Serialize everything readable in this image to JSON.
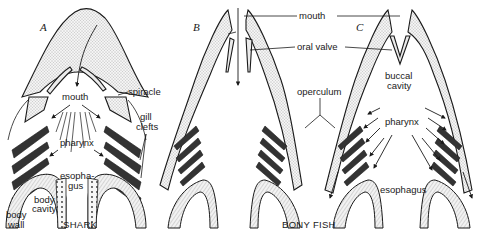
{
  "figure": {
    "panels": [
      {
        "letter": "A",
        "caption": "SHARK"
      },
      {
        "letter": "B",
        "caption": ""
      },
      {
        "letter": "C",
        "caption": ""
      }
    ],
    "group_caption": "BONY FISH",
    "labels": {
      "shark_mouth": "mouth",
      "spiracle": "spiracle",
      "gill_clefts_1": "gill",
      "gill_clefts_2": "clefts",
      "shark_pharynx": "pharynx",
      "shark_esophagus_1": "esopha-",
      "shark_esophagus_2": "gus",
      "body_cavity_1": "body",
      "body_cavity_2": "cavity",
      "body_wall_1": "body",
      "body_wall_2": "wall",
      "mouth": "mouth",
      "oral_valve": "oral valve",
      "operculum": "operculum",
      "buccal_cavity_1": "buccal",
      "buccal_cavity_2": "cavity",
      "pharynx": "pharynx",
      "esophagus": "esophagus"
    }
  }
}
